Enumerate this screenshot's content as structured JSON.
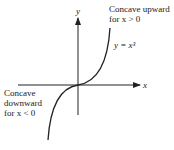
{
  "figure": {
    "axis_x_label": "x",
    "axis_y_label": "y",
    "curve_label": "y = x³",
    "annotation_upper": {
      "line1": "Concave upward",
      "line2": "for x > 0"
    },
    "annotation_lower": {
      "line1": "Concave",
      "line2": "downward",
      "line3": "for x < 0"
    },
    "colors": {
      "axis": "#222222",
      "curve": "#222222",
      "background": "#ffffff"
    }
  }
}
